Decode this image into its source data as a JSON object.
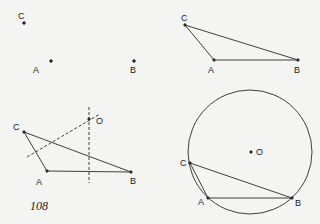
{
  "page_number": "108",
  "colors": {
    "ink": "#2a2a2a",
    "paper": "#f4f4f2"
  },
  "panels": [
    {
      "id": "points-only",
      "points": {
        "A": "A",
        "B": "B",
        "C": "C"
      }
    },
    {
      "id": "triangle",
      "points": {
        "A": "A",
        "B": "B",
        "C": "C"
      }
    },
    {
      "id": "perpendicular-bisectors",
      "points": {
        "A": "A",
        "B": "B",
        "C": "C",
        "O": "O"
      }
    },
    {
      "id": "circumcircle",
      "points": {
        "A": "A",
        "B": "B",
        "C": "C",
        "O": "O"
      }
    }
  ]
}
